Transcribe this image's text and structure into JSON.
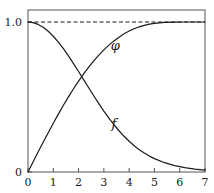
{
  "chart_data": {
    "type": "line",
    "title": "",
    "xlabel": "",
    "ylabel": "",
    "xlim": [
      0,
      7
    ],
    "ylim": [
      0,
      1.08
    ],
    "grid": false,
    "legend_position": "inline-annotations",
    "x_ticks": [
      0,
      1,
      2,
      3,
      4,
      5,
      6,
      7
    ],
    "x_tick_labels": [
      "0",
      "1",
      "2",
      "3",
      "4",
      "5",
      "6",
      "7"
    ],
    "y_ticks": [
      0,
      1.0
    ],
    "y_tick_labels": [
      "0",
      "1.0"
    ],
    "annotations": [
      {
        "text": "φ",
        "x": 3.45,
        "y": 0.845
      },
      {
        "text": "f",
        "x": 3.4,
        "y": 0.33
      }
    ],
    "reference_lines": [
      {
        "orientation": "horizontal",
        "y": 1.0,
        "style": "dashed",
        "color": "#1a1a1a"
      }
    ],
    "series": [
      {
        "name": "φ",
        "style": "solid",
        "color": "#1a1a1a",
        "x": [
          0,
          0.2,
          0.4,
          0.6,
          0.8,
          1.0,
          1.2,
          1.4,
          1.6,
          1.8,
          2.0,
          2.2,
          2.4,
          2.6,
          2.8,
          3.0,
          3.2,
          3.4,
          3.6,
          3.8,
          4.0,
          4.2,
          4.4,
          4.6,
          4.8,
          5.0,
          5.4,
          5.8,
          6.2,
          6.6,
          7.0
        ],
        "values": [
          0.0,
          0.066,
          0.133,
          0.198,
          0.262,
          0.325,
          0.386,
          0.445,
          0.501,
          0.555,
          0.606,
          0.654,
          0.699,
          0.741,
          0.779,
          0.814,
          0.846,
          0.874,
          0.899,
          0.921,
          0.94,
          0.955,
          0.968,
          0.978,
          0.986,
          0.991,
          0.997,
          0.999,
          1.0,
          1.0,
          1.0
        ]
      },
      {
        "name": "f",
        "style": "solid",
        "color": "#1a1a1a",
        "x": [
          0,
          0.2,
          0.4,
          0.6,
          0.8,
          1.0,
          1.2,
          1.4,
          1.6,
          1.8,
          2.0,
          2.2,
          2.4,
          2.6,
          2.8,
          3.0,
          3.2,
          3.4,
          3.6,
          3.8,
          4.0,
          4.2,
          4.4,
          4.6,
          4.8,
          5.0,
          5.4,
          5.8,
          6.2,
          6.6,
          7.0
        ],
        "values": [
          1.0,
          0.996,
          0.984,
          0.965,
          0.938,
          0.905,
          0.866,
          0.822,
          0.774,
          0.723,
          0.67,
          0.616,
          0.562,
          0.508,
          0.456,
          0.406,
          0.359,
          0.315,
          0.275,
          0.238,
          0.205,
          0.175,
          0.149,
          0.126,
          0.106,
          0.089,
          0.062,
          0.042,
          0.029,
          0.019,
          0.013
        ]
      }
    ],
    "axes": {
      "frame": true,
      "frame_color": "#555555",
      "axis_color": "#555555"
    }
  }
}
